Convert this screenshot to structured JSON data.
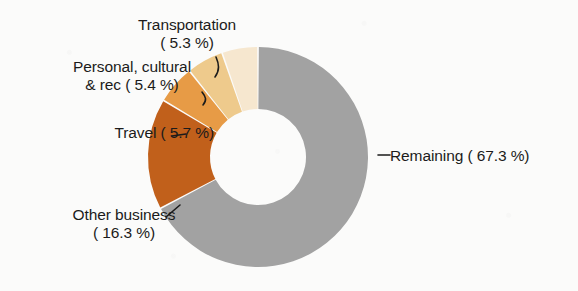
{
  "chart_data": {
    "type": "pie",
    "variant": "donut",
    "title": "",
    "subtitle": "",
    "xlabel": "",
    "ylabel": "",
    "legend_position": "callout-labels",
    "grid": false,
    "units": "percent",
    "total": 100.0,
    "categories": [
      "Remaining",
      "Transportation",
      "Personal, cultural & rec",
      "Travel",
      "Other business"
    ],
    "values": [
      67.3,
      5.3,
      5.4,
      5.7,
      16.3
    ],
    "colors": [
      "#a2a2a2",
      "#f6e7cf",
      "#eeca8c",
      "#e79b46",
      "#c1601b"
    ],
    "slices": [
      {
        "name": "Remaining",
        "value": 67.3,
        "color": "#a2a2a2",
        "label_line1": "Remaining ( 67.3 %)",
        "label_line2": ""
      },
      {
        "name": "Transportation",
        "value": 5.3,
        "color": "#f6e7cf",
        "label_line1": "Transportation",
        "label_line2": "( 5.3 %)"
      },
      {
        "name": "Personal, cultural & rec",
        "value": 5.4,
        "color": "#eeca8c",
        "label_line1": "Personal, cultural",
        "label_line2": "& rec ( 5.4 %)"
      },
      {
        "name": "Travel",
        "value": 5.7,
        "color": "#e79b46",
        "label_line1": "Travel ( 5.7 %)",
        "label_line2": ""
      },
      {
        "name": "Other business",
        "value": 16.3,
        "color": "#c1601b",
        "label_line1": "Other business",
        "label_line2": "( 16.3 %)"
      }
    ]
  },
  "labels": {
    "transportation_line1": "Transportation",
    "transportation_line2": "( 5.3 %)",
    "personal_line1": "Personal, cultural",
    "personal_line2": "& rec ( 5.4 %)",
    "travel_line1": "Travel ( 5.7 %)",
    "other_business_line1": "Other business",
    "other_business_line2": "( 16.3 %)",
    "remaining_line1": "Remaining ( 67.3 %)"
  }
}
